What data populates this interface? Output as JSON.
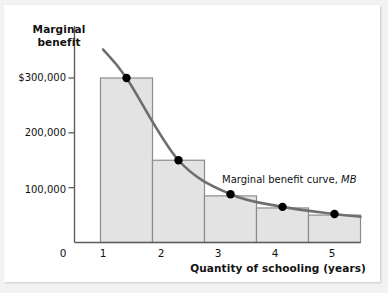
{
  "figure": {
    "y_axis_title_line1": "Marginal",
    "y_axis_title_line2": "benefit",
    "x_axis_title": "Quantity of schooling (years)",
    "curve_annotation_text": "Marginal benefit curve, ",
    "curve_annotation_symbol": "MB",
    "origin_label": "0"
  },
  "chart_data": {
    "type": "bar",
    "title": "",
    "xlabel": "Quantity of schooling (years)",
    "ylabel": "Marginal benefit",
    "categories": [
      "1",
      "2",
      "3",
      "4",
      "5"
    ],
    "values": [
      300000,
      150000,
      85000,
      63000,
      50000
    ],
    "x_tick_labels": [
      "0",
      "1",
      "2",
      "3",
      "4",
      "5"
    ],
    "y_tick_labels": [
      "$300,000",
      "200,000",
      "100,000"
    ],
    "y_tick_values": [
      300000,
      200000,
      100000
    ],
    "ylim": [
      0,
      345000
    ],
    "xlim": [
      0,
      5.5
    ],
    "grid": false,
    "legend_position": "inline-annotation",
    "series": [
      {
        "name": "Marginal benefit bars",
        "type": "bar",
        "values": [
          300000,
          150000,
          85000,
          63000,
          50000
        ]
      },
      {
        "name": "Marginal benefit curve, MB",
        "type": "line",
        "x": [
          0.55,
          1,
          2,
          3,
          4,
          5,
          5.5
        ],
        "values": [
          352000,
          300000,
          150000,
          88000,
          65000,
          52000,
          47000
        ],
        "markers_x": [
          1,
          2,
          3,
          4,
          5
        ],
        "markers_y": [
          300000,
          150000,
          88000,
          65000,
          52000
        ]
      }
    ],
    "colors": {
      "bar_fill": "#e3e3e3",
      "bar_edge": "#8c8c8c",
      "curve": "#6f6e6e",
      "marker": "#000000",
      "axis": "#5c5c5c",
      "text": "#111111",
      "page_background": "#f2f2f2",
      "paper": "#ffffff"
    }
  }
}
